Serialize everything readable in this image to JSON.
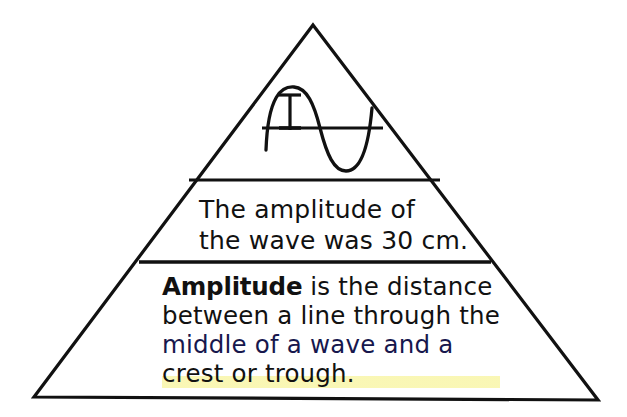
{
  "figure": {
    "kind": "knowledge-pyramid-diagram",
    "topic": "Amplitude",
    "background_color": "#ffffff",
    "stroke_color": "#111111"
  },
  "pyramid": {
    "apex": {
      "x": 313,
      "y": 25
    },
    "bottom_left": {
      "x": 34,
      "y": 397
    },
    "bottom_right": {
      "x": 598,
      "y": 400
    },
    "stroke_width": 3.2,
    "dividers": [
      {
        "name": "divider-upper",
        "y": 180,
        "x1": 189,
        "x2": 440,
        "stroke_width": 3.2
      },
      {
        "name": "divider-lower",
        "y": 262,
        "x1": 139,
        "x2": 491,
        "stroke_width": 3.4
      }
    ]
  },
  "tiers": {
    "top": {
      "name": "wave-diagram-tier",
      "content_type": "illustration",
      "illustration": "sine-wave-with-amplitude-marker"
    },
    "middle": {
      "name": "example-statement-tier",
      "content_type": "text",
      "lines": [
        "The amplitude of",
        "the wave was 30 cm."
      ]
    },
    "bottom": {
      "name": "definition-tier",
      "content_type": "text",
      "term": "Amplitude",
      "lines": [
        " is the distance",
        "between a line through the",
        "middle of a wave and a",
        "crest or trough."
      ],
      "full_text": "Amplitude is the distance between a line through the middle of a wave and a crest or trough."
    }
  },
  "wave_diagram": {
    "midline": {
      "x1": 262,
      "x2": 383,
      "y": 128,
      "stroke_width": 3.2
    },
    "wave_path": {
      "start_x": 266,
      "end_x": 372,
      "crest_x": 294,
      "crest_y": 89,
      "trough_x": 345,
      "trough_y": 170,
      "stroke_width": 3.2
    },
    "amplitude_marker": {
      "type": "i-beam",
      "x": 290,
      "top_y": 94,
      "bottom_y": 130,
      "cap_half_width": 11,
      "stroke_width": 3
    },
    "measures": "distance from midline to crest"
  }
}
